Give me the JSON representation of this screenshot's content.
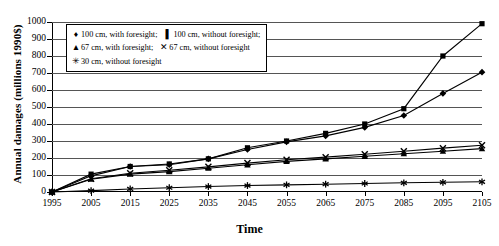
{
  "chart_data": {
    "type": "line",
    "title": "",
    "xlabel": "Time",
    "ylabel": "Annual damages (millions 1990$)",
    "x": [
      1995,
      2005,
      2015,
      2025,
      2035,
      2045,
      2055,
      2065,
      2075,
      2085,
      2095,
      2105
    ],
    "xticklabels": [
      "1995",
      "2005",
      "2015",
      "2025",
      "2035",
      "2045",
      "2055",
      "2065",
      "2075",
      "2085",
      "2095",
      "2105"
    ],
    "yticklabels": [
      "0",
      "100",
      "200",
      "300",
      "400",
      "500",
      "600",
      "700",
      "800",
      "900",
      "1000"
    ],
    "ylim": [
      0,
      1000
    ],
    "ytick_step": 100,
    "grid": true,
    "legend_position": "upper-left-inside",
    "series": [
      {
        "name": "100 cm, with foresight",
        "marker": "diamond",
        "marker_glyph": "♦",
        "color": "#000000",
        "values": [
          0,
          95,
          150,
          160,
          195,
          250,
          295,
          330,
          380,
          450,
          580,
          705
        ]
      },
      {
        "name": "100 cm, without foresight",
        "marker": "square",
        "marker_glyph": "■",
        "color": "#000000",
        "values": [
          0,
          105,
          150,
          165,
          195,
          260,
          300,
          345,
          400,
          490,
          800,
          990
        ]
      },
      {
        "name": "67 cm, with foresight",
        "marker": "triangle",
        "marker_glyph": "▲",
        "color": "#000000",
        "values": [
          0,
          75,
          105,
          120,
          140,
          160,
          180,
          195,
          210,
          225,
          240,
          255
        ]
      },
      {
        "name": "67 cm, without foresight",
        "marker": "cross",
        "marker_glyph": "✕",
        "color": "#000000",
        "values": [
          0,
          78,
          110,
          128,
          148,
          170,
          190,
          205,
          222,
          240,
          258,
          275
        ]
      },
      {
        "name": "30 cm, without foresight",
        "marker": "star",
        "marker_glyph": "✳",
        "color": "#000000",
        "values": [
          0,
          8,
          18,
          25,
          32,
          38,
          42,
          46,
          50,
          54,
          57,
          60
        ]
      }
    ]
  },
  "legend": {
    "rows": [
      [
        {
          "marker": "♦",
          "label": "100 cm, with foresight;"
        },
        {
          "marker": "▌",
          "label": "100 cm, without foresight;"
        }
      ],
      [
        {
          "marker": "▲",
          "label": "67 cm, with foresight;"
        },
        {
          "marker": "✕",
          "label": "67 cm, without foresight"
        }
      ],
      [
        {
          "marker": "✳",
          "label": "30 cm, without foresight"
        }
      ]
    ]
  }
}
